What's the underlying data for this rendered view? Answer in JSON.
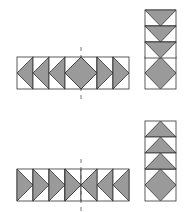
{
  "colors": {
    "fill": "#9a9a9a",
    "stroke": "#333333",
    "axis": "#555555",
    "background": "#ffffff"
  },
  "figures": [
    {
      "name": "top-figure",
      "row_y": 57,
      "row_cells": [
        "left",
        "left",
        "left",
        "diamond-split",
        "right",
        "right",
        "right"
      ],
      "column_y": 10,
      "column_cells": [
        "down",
        "down",
        "down"
      ],
      "axis": {
        "x": 81,
        "y1": 47,
        "y2": 101
      }
    },
    {
      "name": "bottom-figure",
      "row_y": 169,
      "row_cells": [
        "right",
        "right",
        "right",
        "bowtie",
        "left",
        "left",
        "left"
      ],
      "column_y": 121,
      "column_cells": [
        "up",
        "up",
        "up"
      ],
      "axis": {
        "x": 81,
        "y1": 159,
        "y2": 211
      }
    }
  ]
}
